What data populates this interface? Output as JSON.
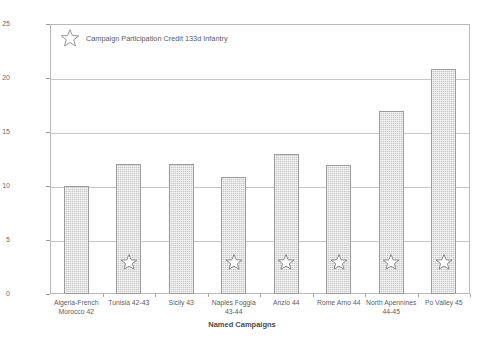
{
  "chart_data": {
    "type": "bar",
    "title": "",
    "xlabel": "Named Campaigns",
    "ylabel": "Number of Regiments participating at some time",
    "ylim": [
      0,
      25
    ],
    "yticks": [
      0,
      5,
      10,
      15,
      20,
      25
    ],
    "grid": true,
    "legend_position": "top-left",
    "legend": [
      {
        "marker": "star-icon",
        "label": "Campaign Participation Credit 133d Infantry"
      }
    ],
    "categories": [
      "Algeria-French Morocco 42",
      "Tunisia 42-43",
      "Sicily 43",
      "Naples Foggia 43-44",
      "Anzio 44",
      "Rome Arno 44",
      "North Apennines 44-45",
      "Po Valley 45"
    ],
    "category_lines": [
      [
        "Algeria-French",
        "Morocco 42"
      ],
      [
        "Tunisia 42-43"
      ],
      [
        "Sicily 43"
      ],
      [
        "Naples Foggia",
        "43-44"
      ],
      [
        "Anzio 44"
      ],
      [
        "Rome Arno 44"
      ],
      [
        "North Apennines",
        "44-45"
      ],
      [
        "Po Valley 45"
      ]
    ],
    "values": [
      10,
      12,
      12,
      10.8,
      13,
      11.9,
      16.9,
      20.8
    ],
    "star_marked": [
      false,
      true,
      false,
      true,
      true,
      true,
      true,
      true
    ],
    "star_value": 3,
    "colors": {
      "bar_fill": "#d8d8d8",
      "bar_border": "#9c9c9c",
      "gridline": "#c6c6c6",
      "frame": "#b9b9b9",
      "text": "#5a5a5a"
    }
  },
  "y_tick_labels": [
    "0",
    "5",
    "10",
    "15",
    "20",
    "25"
  ]
}
